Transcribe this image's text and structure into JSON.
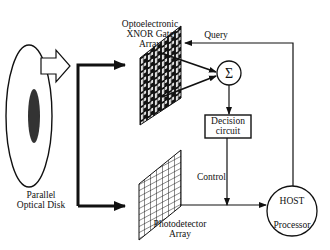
{
  "diagram": {
    "nodes": {
      "disk": {
        "line1": "Parallel",
        "line2": "Optical Disk"
      },
      "xnor": {
        "line1": "Optoelectronic",
        "line2": "XNOR Gate",
        "line3": "Array"
      },
      "sum": {
        "symbol": "Σ"
      },
      "decision": {
        "line1": "Decision",
        "line2": "circuit"
      },
      "photodetector": {
        "line1": "Photodetector",
        "line2": "Array"
      },
      "host": {
        "line1": "HOST",
        "line2": "Processor"
      }
    },
    "edges": {
      "query": "Query",
      "control": "Control"
    },
    "colors": {
      "ink": "#111111",
      "background": "#ffffff"
    }
  }
}
